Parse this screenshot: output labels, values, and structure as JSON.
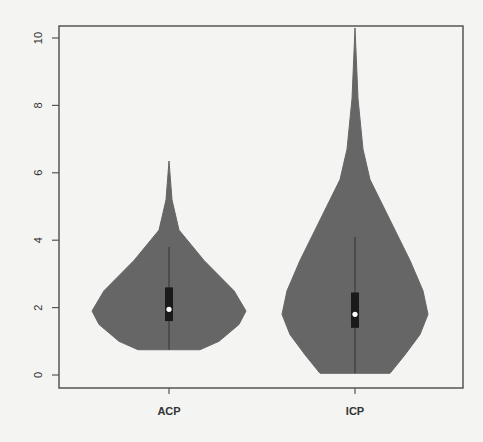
{
  "chart_data": {
    "type": "violin",
    "title": "",
    "xlabel": "",
    "ylabel": "",
    "ylim": [
      0,
      10.4
    ],
    "yticks": [
      "0",
      "2",
      "4",
      "6",
      "8",
      "10"
    ],
    "categories": [
      "ACP",
      "ICP"
    ],
    "colors": {
      "violin": "#666666",
      "box": "#1a1a1a",
      "median": "#ffffff",
      "axis": "#555555"
    },
    "series": [
      {
        "name": "ACP",
        "min": 0.75,
        "max": 6.35,
        "q1": 1.6,
        "median": 1.95,
        "q3": 2.6,
        "whisker_high": 3.8,
        "whisker_low": 0.75,
        "density_profile": [
          [
            6.35,
            0
          ],
          [
            5.2,
            3
          ],
          [
            4.3,
            10
          ],
          [
            3.4,
            35
          ],
          [
            2.5,
            65
          ],
          [
            1.9,
            77
          ],
          [
            1.5,
            70
          ],
          [
            1.0,
            50
          ],
          [
            0.75,
            31
          ]
        ]
      },
      {
        "name": "ICP",
        "min": 0.05,
        "max": 10.3,
        "q1": 1.4,
        "median": 1.8,
        "q3": 2.45,
        "whisker_high": 4.1,
        "whisker_low": 0.05,
        "density_profile": [
          [
            10.3,
            0
          ],
          [
            8.2,
            3
          ],
          [
            6.7,
            8
          ],
          [
            5.8,
            15
          ],
          [
            4.6,
            35
          ],
          [
            3.4,
            55
          ],
          [
            2.5,
            68
          ],
          [
            1.8,
            73
          ],
          [
            1.2,
            65
          ],
          [
            0.6,
            50
          ],
          [
            0.05,
            35
          ]
        ]
      }
    ]
  }
}
